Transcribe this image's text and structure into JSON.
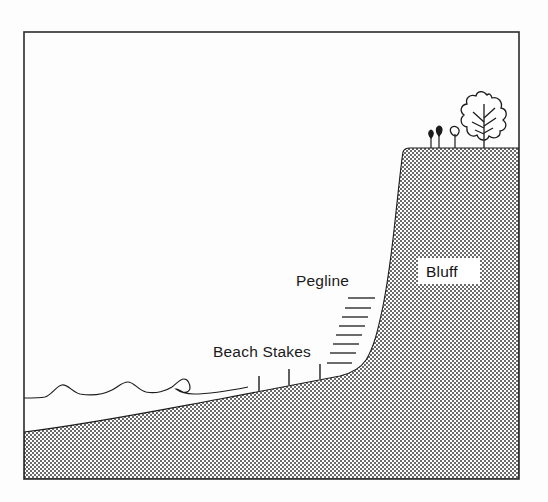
{
  "figure": {
    "background_color": "#fdfdfd",
    "frame": {
      "name": "diagram-border",
      "stroke_color": "#2b2b2b",
      "x": 24,
      "y": 32,
      "width": 495,
      "height": 447
    }
  },
  "labels": {
    "pegline": "Pegline",
    "beach_stakes": "Beach Stakes",
    "bluff": "Bluff"
  },
  "colors": {
    "ink": "#1c1c1c",
    "hatch_dark": "#6e6e6e",
    "hatch_light": "#ffffff",
    "label_box_fill": "#ffffff",
    "water_line": "#2a2a2a"
  },
  "elements": {
    "tree_label": "deciduous-tree",
    "shrub_count": 3,
    "beach_stake_count": 3,
    "pegline_tick_count": 8,
    "wave_crest_count": 4
  },
  "geometry": {
    "bluff_top_y": 148,
    "bluff_crest_x": 403,
    "beach_toe_x": 345,
    "waterline_y": 395,
    "ground_bottom_y": 478
  }
}
